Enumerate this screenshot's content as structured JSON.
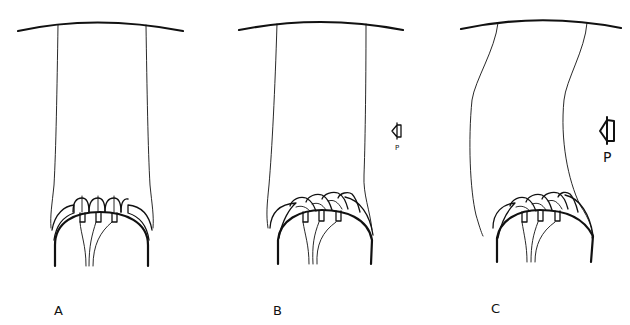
{
  "figure": {
    "panels": [
      {
        "id": "A",
        "label": "A",
        "tilt": 0,
        "arrow": null
      },
      {
        "id": "B",
        "label": "B",
        "tilt": 1,
        "arrow": {
          "label": "P",
          "size": "small"
        }
      },
      {
        "id": "C",
        "label": "C",
        "tilt": 2,
        "arrow": {
          "label": "P",
          "size": "large"
        }
      }
    ]
  }
}
